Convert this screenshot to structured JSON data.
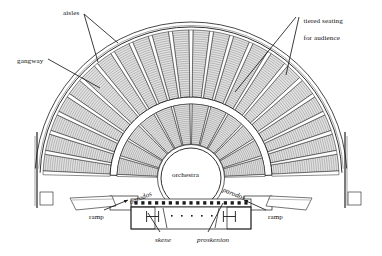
{
  "figure": {
    "kind": "ancient-greek-theatre-plan",
    "background_color": "#ffffff",
    "ink_color": "#1a1a1a",
    "seat_fill_color": "#d8d8d8",
    "seat_hatch_color": "#6e6e6e"
  },
  "labels": {
    "aisles": "aisles",
    "tiered_seating_line1": "tiered seating",
    "tiered_seating_line2": "for audience",
    "gangway": "gangway",
    "orchestra": "orchestra",
    "parodos_left": "parodos",
    "parodos_right": "parodos",
    "ramp_left": "ramp",
    "ramp_right": "ramp",
    "skene": "skene",
    "proskenion": "proskenion"
  },
  "label_positions": {
    "aisles": {
      "x": 63,
      "y": 9
    },
    "tiered_seating": {
      "x": 296,
      "y": 8
    },
    "gangway": {
      "x": 17,
      "y": 57
    },
    "orchestra": {
      "x": 172,
      "y": 171
    },
    "parodos_left": {
      "x": 129,
      "y": 194,
      "rot": -22
    },
    "parodos_right": {
      "x": 222,
      "y": 190,
      "rot": 22
    },
    "ramp_left": {
      "x": 89,
      "y": 213
    },
    "ramp_right": {
      "x": 268,
      "y": 213
    },
    "skene": {
      "x": 155,
      "y": 236
    },
    "proskenion": {
      "x": 197,
      "y": 236
    }
  },
  "geometry": {
    "center": {
      "x": 191,
      "y": 178
    },
    "orchestra_radius": 30,
    "lower_cavea": {
      "inner_r": 34,
      "outer_r": 74,
      "wedges": 12,
      "rows": 21
    },
    "diazoma": {
      "inner_r": 74,
      "outer_r": 81
    },
    "upper_cavea": {
      "inner_r": 81,
      "outer_r": 148,
      "wedges": 22,
      "rows": 30
    },
    "sweep": {
      "start_deg": 182,
      "end_deg": 358
    },
    "outer_wall_r": 156
  },
  "leader_lines": {
    "aisles": [
      {
        "x1": 84,
        "y1": 14,
        "x2": 118,
        "y2": 43
      },
      {
        "x1": 84,
        "y1": 14,
        "x2": 98,
        "y2": 62
      }
    ],
    "tiered_seating": [
      {
        "x1": 296,
        "y1": 17,
        "x2": 235,
        "y2": 92
      },
      {
        "x1": 299,
        "y1": 17,
        "x2": 286,
        "y2": 75
      }
    ],
    "gangway": [
      {
        "x1": 48,
        "y1": 59,
        "x2": 100,
        "y2": 88
      }
    ],
    "ramp_left": [
      {
        "x1": 104,
        "y1": 210,
        "x2": 128,
        "y2": 200
      }
    ],
    "ramp_right": [
      {
        "x1": 266,
        "y1": 210,
        "x2": 244,
        "y2": 200
      }
    ],
    "skene": [
      {
        "x1": 160,
        "y1": 232,
        "x2": 148,
        "y2": 213
      }
    ],
    "proskenion": [
      {
        "x1": 208,
        "y1": 232,
        "x2": 223,
        "y2": 203
      }
    ]
  },
  "stage_building": {
    "skene_rect": {
      "x": 131,
      "y": 207,
      "w": 120,
      "h": 22
    },
    "proskenion_band": {
      "x": 131,
      "y": 199,
      "w": 120,
      "h": 8
    },
    "colonnade_dots": 17,
    "parodos_left_rect": {
      "x": 110,
      "y": 196,
      "w": 28,
      "h": 14
    },
    "parodos_right_rect": {
      "x": 244,
      "y": 196,
      "w": 28,
      "h": 14
    }
  }
}
